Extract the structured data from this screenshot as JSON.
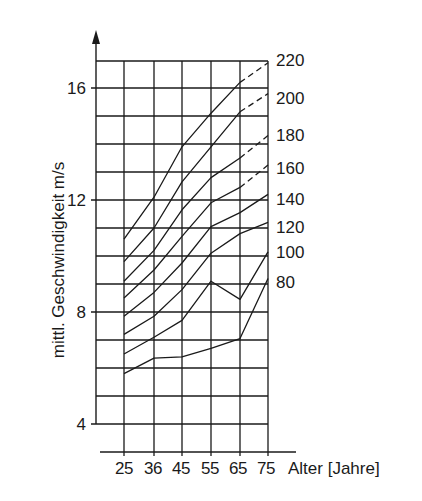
{
  "chart_data": {
    "type": "line",
    "title": "",
    "xlabel": "Alter [Jahre]",
    "ylabel": "mittl. Geschwindigkeit m/s",
    "x": [
      25,
      36,
      45,
      55,
      65,
      75
    ],
    "x_tick_labels": [
      "25",
      "36",
      "45",
      "55",
      "65",
      "75"
    ],
    "y_tick_labels": [
      "4",
      "8",
      "12",
      "16"
    ],
    "y_ticks": [
      4,
      8,
      12,
      16
    ],
    "ylim": [
      4,
      17.8
    ],
    "grid": true,
    "legend_position": "right (inline series labels)",
    "series": [
      {
        "name": "220",
        "values": [
          10.6,
          12.1,
          13.9,
          15.1,
          16.2,
          16.9
        ],
        "dashed_from_x": 65
      },
      {
        "name": "200",
        "values": [
          9.8,
          11.0,
          12.65,
          13.9,
          15.15,
          15.8
        ],
        "dashed_from_x": 65
      },
      {
        "name": "180",
        "values": [
          9.1,
          10.2,
          11.65,
          12.8,
          13.5,
          14.3
        ],
        "dashed_from_x": 65
      },
      {
        "name": "160",
        "values": [
          8.5,
          9.5,
          10.7,
          11.9,
          12.45,
          13.25
        ],
        "dashed_from_x": 65
      },
      {
        "name": "140",
        "values": [
          7.85,
          8.7,
          9.75,
          11.05,
          11.55,
          12.2
        ],
        "dashed_from_x": null
      },
      {
        "name": "120",
        "values": [
          7.2,
          7.85,
          8.8,
          10.1,
          10.8,
          11.2
        ],
        "dashed_from_x": null
      },
      {
        "name": "100",
        "values": [
          6.5,
          7.1,
          7.7,
          9.1,
          8.45,
          10.15
        ],
        "dashed_from_x": null
      },
      {
        "name": "80",
        "values": [
          5.8,
          6.35,
          6.4,
          6.7,
          7.05,
          9.2
        ],
        "dashed_from_x": null
      }
    ]
  },
  "labels": {
    "ylabel": "mittl. Geschwindigkeit m/s",
    "xlabel": "Alter [Jahre]"
  },
  "colors": {
    "line": "#1a1a1a",
    "background": "#ffffff"
  }
}
